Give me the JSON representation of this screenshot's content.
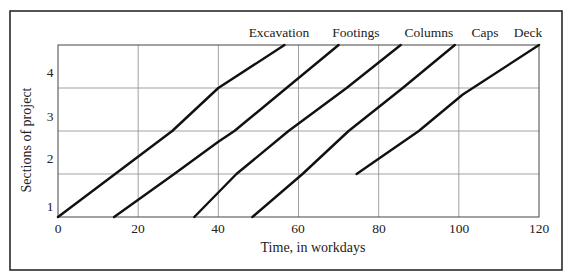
{
  "chart_data": {
    "type": "line",
    "title": "",
    "xlabel": "Time, in workdays",
    "ylabel": "Sections of project",
    "xlim": [
      0,
      120
    ],
    "ylim": [
      0,
      4
    ],
    "x_ticks": [
      0,
      20,
      40,
      60,
      80,
      100,
      120
    ],
    "y_tick_labels": [
      "1",
      "2",
      "3",
      "4"
    ],
    "grid": true,
    "legend_position": "series labels above plot at line ends",
    "series": [
      {
        "name": "Excavation",
        "points": [
          [
            0,
            0
          ],
          [
            28.5,
            2
          ],
          [
            40,
            3
          ],
          [
            56.5,
            4
          ]
        ]
      },
      {
        "name": "Footings",
        "points": [
          [
            14,
            0
          ],
          [
            29,
            1
          ],
          [
            40,
            1.75
          ],
          [
            44,
            2
          ],
          [
            57,
            3
          ],
          [
            70,
            4
          ]
        ]
      },
      {
        "name": "Columns",
        "points": [
          [
            34,
            0
          ],
          [
            44.5,
            1
          ],
          [
            57.5,
            2
          ],
          [
            72,
            3
          ],
          [
            85.5,
            4
          ]
        ]
      },
      {
        "name": "Caps",
        "points": [
          [
            48.5,
            0
          ],
          [
            61,
            1
          ],
          [
            72.5,
            2
          ],
          [
            86,
            3
          ],
          [
            99,
            4
          ]
        ]
      },
      {
        "name": "Deck",
        "points": [
          [
            74.5,
            1
          ],
          [
            90,
            2
          ],
          [
            101,
            2.85
          ],
          [
            120,
            4
          ]
        ]
      }
    ]
  },
  "labels": {
    "xlabel": "Time, in workdays",
    "ylabel": "Sections of project",
    "x_ticks": [
      "0",
      "20",
      "40",
      "60",
      "80",
      "100",
      "120"
    ],
    "y_ticks": [
      "1",
      "2",
      "3",
      "4"
    ],
    "series_names": [
      "Excavation",
      "Footings",
      "Columns",
      "Caps",
      "Deck"
    ]
  }
}
